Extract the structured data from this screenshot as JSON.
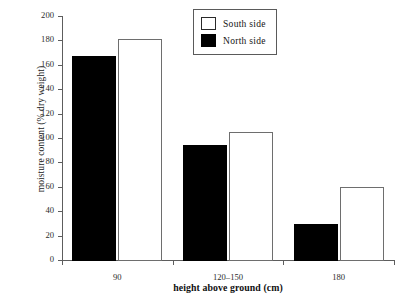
{
  "chart_data": {
    "type": "bar",
    "title": "",
    "xlabel": "height above ground (cm)",
    "ylabel": "moisture content (% dry weight)",
    "categories": [
      "90",
      "120–150",
      "180"
    ],
    "series": [
      {
        "name": "North side",
        "color": "#000000",
        "values": [
          168,
          95,
          30
        ]
      },
      {
        "name": "South side",
        "color": "#ffffff",
        "values": [
          182,
          106,
          61
        ]
      }
    ],
    "ylim": [
      0,
      200
    ],
    "yticks": [
      0,
      20,
      40,
      60,
      80,
      100,
      120,
      140,
      160,
      180,
      200
    ],
    "ytick_labels": [
      "0",
      "20",
      "40",
      "60",
      "80",
      "100",
      "120",
      "140",
      "160",
      "180",
      "200"
    ],
    "grid": false,
    "legend_position": "top-right",
    "legend_entries": [
      {
        "label": "South side",
        "swatch": "open-square"
      },
      {
        "label": "North side",
        "swatch": "filled-square"
      }
    ]
  },
  "axes": {
    "y_title": "moisture content (% dry weight)",
    "x_title": "height above ground (cm)"
  }
}
